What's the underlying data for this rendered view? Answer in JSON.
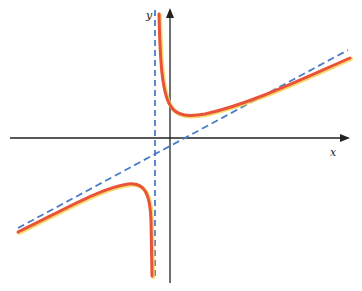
{
  "figure": {
    "axes": {
      "x_label": "x",
      "y_label": "y"
    },
    "colors": {
      "curve": "#e8533a",
      "curve_glow": "#f5d24a",
      "asymptote": "#4a7cc9",
      "axis": "#222222"
    },
    "elements": [
      {
        "name": "curve",
        "style": "solid orange-red",
        "branches": 2
      },
      {
        "name": "vertical-asymptote",
        "style": "dashed blue",
        "position": "left of y-axis"
      },
      {
        "name": "oblique-asymptote",
        "style": "dashed blue",
        "slope": "positive"
      }
    ]
  }
}
